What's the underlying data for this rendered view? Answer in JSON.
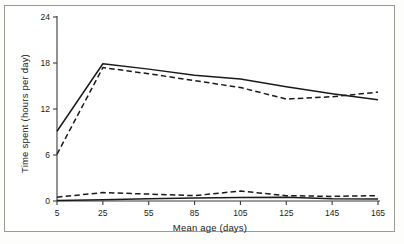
{
  "chart_data": {
    "type": "line",
    "title": "",
    "xlabel": "Mean age (days)",
    "ylabel": "Time spent (hours per day)",
    "x": [
      5,
      25,
      55,
      85,
      105,
      125,
      145,
      165
    ],
    "xtick_labels": [
      "5",
      "25",
      "55",
      "85",
      "105",
      "125",
      "145",
      "165"
    ],
    "ytick_labels": [
      "0",
      "6",
      "12",
      "18",
      "24"
    ],
    "yticks": [
      0,
      6,
      12,
      18,
      24
    ],
    "ylim": [
      0,
      24
    ],
    "grid": false,
    "legend": "none",
    "series": [
      {
        "name": "upper-solid",
        "style": "solid",
        "color": "#1a1a1a",
        "values": [
          9.1,
          17.9,
          17.2,
          16.4,
          15.9,
          14.9,
          14.0,
          13.2
        ]
      },
      {
        "name": "upper-dashed",
        "style": "dashed",
        "color": "#1a1a1a",
        "values": [
          6.1,
          17.4,
          16.6,
          15.7,
          14.8,
          13.3,
          13.6,
          14.2
        ]
      },
      {
        "name": "lower-dashed",
        "style": "dashed",
        "color": "#1a1a1a",
        "values": [
          0.5,
          1.1,
          0.9,
          0.7,
          1.3,
          0.7,
          0.6,
          0.7
        ]
      },
      {
        "name": "lower-solid",
        "style": "solid",
        "color": "#1a1a1a",
        "values": [
          0.05,
          0.15,
          0.3,
          0.4,
          0.45,
          0.5,
          0.3,
          0.25
        ]
      }
    ]
  },
  "axes": {
    "x_tick_labels": [
      "5",
      "25",
      "55",
      "85",
      "105",
      "125",
      "145",
      "165"
    ],
    "y_tick_labels": [
      "0",
      "6",
      "12",
      "18",
      "24"
    ],
    "x_axis_title": "Mean age (days)",
    "y_axis_title": "Time spent (hours per day)"
  }
}
